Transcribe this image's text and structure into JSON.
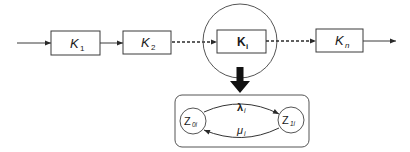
{
  "diagram": {
    "type": "block-diagram-with-state-detail",
    "colors": {
      "stroke": "#3a3a3a",
      "fill": "#ffffff",
      "text": "#1a1a1a"
    },
    "chain": [
      {
        "id": "k1",
        "symbol": "K",
        "subscript": "1"
      },
      {
        "id": "k2",
        "symbol": "K",
        "subscript": "2"
      },
      {
        "id": "ki",
        "symbol": "K",
        "subscript": "i",
        "highlighted": true
      },
      {
        "id": "kn",
        "symbol": "K",
        "subscript": "n"
      }
    ],
    "connectors": [
      {
        "from": "input",
        "to": "k1",
        "style": "solid"
      },
      {
        "from": "k1",
        "to": "k2",
        "style": "solid"
      },
      {
        "from": "k2",
        "to": "ki",
        "style": "dotted"
      },
      {
        "from": "ki",
        "to": "kn",
        "style": "dotted"
      },
      {
        "from": "kn",
        "to": "output",
        "style": "solid"
      }
    ],
    "detail": {
      "states": [
        {
          "id": "z0",
          "symbol": "Z",
          "subscript": "0i"
        },
        {
          "id": "z1",
          "symbol": "Z",
          "subscript": "1i"
        }
      ],
      "transitions": [
        {
          "from": "z0",
          "to": "z1",
          "symbol": "λ",
          "subscript": "i"
        },
        {
          "from": "z1",
          "to": "z0",
          "symbol": "μ",
          "subscript": "i"
        }
      ]
    }
  }
}
